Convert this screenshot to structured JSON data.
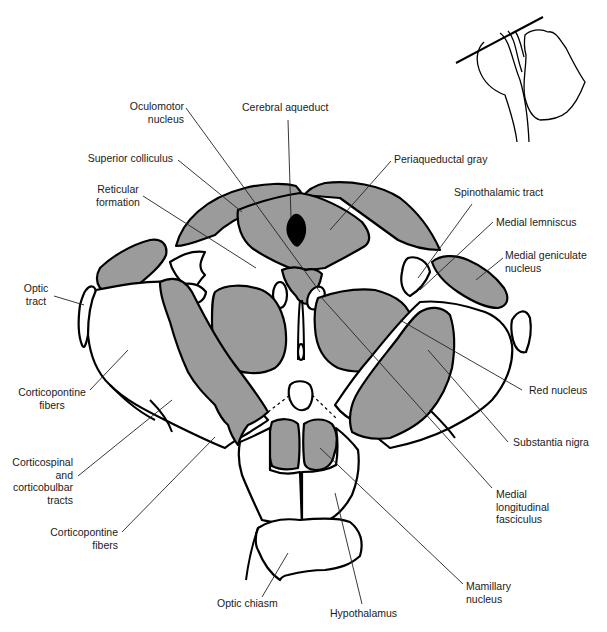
{
  "figure": {
    "fill_gray": "#9b9b9b",
    "outline_color": "#000000",
    "inset": "Sagittal brainstem outline with cutting-plane line"
  },
  "labels": {
    "oculomotor_nucleus": [
      "Oculomotor",
      "nucleus"
    ],
    "cerebral_aqueduct": "Cerebral aqueduct",
    "superior_colliculus": "Superior colliculus",
    "periaqueductal_gray": "Periaqueductal gray",
    "reticular_formation": [
      "Reticular",
      "formation"
    ],
    "spinothalamic_tract": "Spinothalamic tract",
    "medial_lemniscus": "Medial lemniscus",
    "medial_geniculate_nucleus": [
      "Medial geniculate",
      "nucleus"
    ],
    "optic_tract": [
      "Optic",
      "tract"
    ],
    "red_nucleus": "Red nucleus",
    "corticopontine_fibers_upper": [
      "Corticopontine",
      "fibers"
    ],
    "substantia_nigra": "Substantia nigra",
    "corticospinal_corticobulbar": [
      "Corticospinal",
      "and",
      "corticobulbar",
      "tracts"
    ],
    "medial_longitudinal_fasciculus": [
      "Medial",
      "longitudinal",
      "fasciculus"
    ],
    "corticopontine_fibers_lower": [
      "Corticopontine",
      "fibers"
    ],
    "mamillary_nucleus": [
      "Mamillary",
      "nucleus"
    ],
    "optic_chiasm": "Optic chiasm",
    "hypothalamus": "Hypothalamus"
  }
}
